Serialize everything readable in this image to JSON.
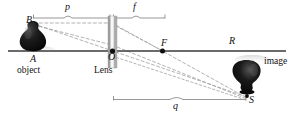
{
  "figure": {
    "background_color": "#ffffff",
    "axis_color": "#3a3a3a",
    "ray_color": "#8c8c8c",
    "object_color": "#101010",
    "image_color": "#101010"
  },
  "points": [
    {
      "id": "B",
      "label": "B",
      "x": 30,
      "y": 22
    },
    {
      "id": "A",
      "label": "A",
      "x": 33,
      "y": 62
    },
    {
      "id": "O",
      "label": "O",
      "x": 110,
      "y": 59
    },
    {
      "id": "F",
      "label": "F",
      "x": 163,
      "y": 44
    },
    {
      "id": "R",
      "label": "R",
      "x": 231,
      "y": 41
    },
    {
      "id": "S",
      "label": "S",
      "x": 247,
      "y": 101
    }
  ],
  "labels": {
    "object": "object",
    "lens": "Lens",
    "image": "image"
  },
  "dimensions": [
    {
      "id": "p",
      "label": "p",
      "from_x": 33,
      "to_x": 110,
      "label_x": 68,
      "label_y": 5,
      "line_y": 18
    },
    {
      "id": "f",
      "label": "f",
      "from_x": 113,
      "to_x": 165,
      "label_x": 136,
      "label_y": 5,
      "line_y": 18
    },
    {
      "id": "q",
      "label": "q",
      "from_x": 113,
      "to_x": 246,
      "label_x": 176,
      "label_y": 103,
      "line_y": 99
    }
  ],
  "optical_axis": {
    "from_x": 8,
    "to_x": 286,
    "y": 51
  },
  "lens": {
    "x": 108,
    "y_top": 16,
    "width": 9,
    "height": 52
  },
  "rays": [
    {
      "id": "parallel-ray",
      "from": "B",
      "via": "lens-top",
      "to": "S"
    },
    {
      "id": "chief-ray",
      "from": "B",
      "via": "O",
      "to": "S"
    },
    {
      "id": "focal-ray",
      "from": "B",
      "via": "F",
      "to": "S"
    }
  ]
}
